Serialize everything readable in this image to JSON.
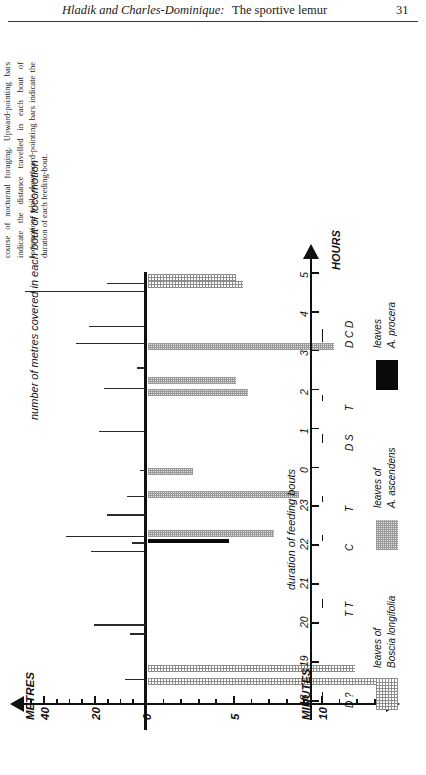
{
  "runhead": {
    "authors": "Hladik and Charles-Dominique:",
    "title": "The sportive lemur",
    "page": "31"
  },
  "caption": {
    "text": "Figure 3. Diagram illustrating movement of an adult male sportive lemur through his home range in the course of nocturnal foraging. Upward-pointing bars indicate the distance travelled in each bout of locomotion, while downward-pointing bars indicate the duration of each feeding-bout."
  },
  "chart_data": {
    "type": "bar",
    "title": "Diagram illustrating movement of an adult male sportive lemur through his home range in the course of nocturnal foraging",
    "orientation": "horizontal-time-vertical",
    "time_axis": {
      "label": "HOURS",
      "ticks": [
        "18",
        "19",
        "20",
        "21",
        "22",
        "23",
        "0",
        "1",
        "2",
        "3",
        "4",
        "5"
      ],
      "range": [
        18,
        29
      ]
    },
    "metres_axis": {
      "label": "METRES",
      "title": "number of metres covered in each bout of locomotion",
      "ticks": [
        "40",
        "20",
        "0"
      ],
      "minor_step": 5,
      "range": [
        0,
        50
      ],
      "direction": "left"
    },
    "minutes_axis": {
      "label": "MINUTES",
      "title": "duration of feeding bouts",
      "ticks": [
        "0",
        "5",
        "10"
      ],
      "minor_step": 1,
      "range": [
        0,
        14
      ],
      "direction": "right"
    },
    "locomotion_bars": [
      {
        "hour": 18.55,
        "metres": 8
      },
      {
        "hour": 19.72,
        "metres": 6
      },
      {
        "hour": 19.95,
        "metres": 20
      },
      {
        "hour": 21.83,
        "metres": 21
      },
      {
        "hour": 22.05,
        "metres": 5
      },
      {
        "hour": 22.22,
        "metres": 31
      },
      {
        "hour": 22.78,
        "metres": 15
      },
      {
        "hour": 23.25,
        "metres": 7
      },
      {
        "hour": 23.92,
        "metres": 2
      },
      {
        "hour": 24.92,
        "metres": 18
      },
      {
        "hour": 26.02,
        "metres": 16
      },
      {
        "hour": 26.55,
        "metres": 3
      },
      {
        "hour": 27.18,
        "metres": 27
      },
      {
        "hour": 27.62,
        "metres": 22
      },
      {
        "hour": 28.52,
        "metres": 47
      },
      {
        "hour": 28.72,
        "metres": 15
      }
    ],
    "feeding_bars": [
      {
        "hour": 18.5,
        "minutes": 14.2,
        "species": "boscia"
      },
      {
        "hour": 18.82,
        "minutes": 11.8,
        "species": "boscia"
      },
      {
        "hour": 22.28,
        "minutes": 7.2,
        "species": "ascendens"
      },
      {
        "hour": 23.3,
        "minutes": 8.6,
        "species": "ascendens"
      },
      {
        "hour": 23.88,
        "minutes": 2.6,
        "species": "ascendens"
      },
      {
        "hour": 25.92,
        "minutes": 5.7,
        "species": "ascendens"
      },
      {
        "hour": 26.22,
        "minutes": 5.0,
        "species": "ascendens"
      },
      {
        "hour": 27.1,
        "minutes": 10.6,
        "species": "ascendens"
      },
      {
        "hour": 28.7,
        "minutes": 5.4,
        "species": "boscia"
      },
      {
        "hour": 28.88,
        "minutes": 5.0,
        "species": "boscia"
      },
      {
        "hour": 22.05,
        "minutes": 4.6,
        "species": "procera"
      }
    ],
    "events": [
      {
        "hour": 18.2,
        "label": "D ?",
        "marks": 1
      },
      {
        "hour": 20.55,
        "label": "T T",
        "marks": 2
      },
      {
        "hour": 22.25,
        "label": "C",
        "marks": 1
      },
      {
        "hour": 23.25,
        "label": "T",
        "marks": 1
      },
      {
        "hour": 24.8,
        "label": "D S",
        "marks": 2
      },
      {
        "hour": 25.85,
        "label": "T",
        "marks": 1
      },
      {
        "hour": 27.45,
        "label": "D C D",
        "marks": 3
      }
    ],
    "legend": {
      "position": "right",
      "entries": [
        {
          "swatch": "boscia",
          "line1": "leaves of",
          "line2": "Boscia longifolia"
        },
        {
          "swatch": "ascendens",
          "line1": "leaves of",
          "line2": "A. ascendens"
        },
        {
          "swatch": "procera",
          "line1": "leaves",
          "line2": "A. procera"
        }
      ]
    }
  }
}
